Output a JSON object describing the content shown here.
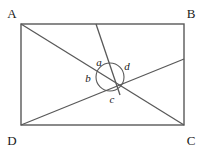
{
  "figure": {
    "stroke_color": "#595959",
    "label_color": "#1a1a1a",
    "background": "#ffffff",
    "vertices": [
      {
        "name": "A",
        "label": "A",
        "x": 21,
        "y": 24,
        "label_x": 12,
        "label_y": 18
      },
      {
        "name": "B",
        "label": "B",
        "x": 184,
        "y": 24,
        "label_x": 188,
        "label_y": 18
      },
      {
        "name": "C",
        "label": "C",
        "x": 184,
        "y": 125,
        "label_x": 188,
        "label_y": 140
      },
      {
        "name": "D",
        "label": "D",
        "x": 21,
        "y": 125,
        "label_x": 12,
        "label_y": 140
      }
    ],
    "intersection": {
      "x": 108,
      "y": 76
    },
    "rectangle": {
      "x": 21,
      "y": 24,
      "width": 163,
      "height": 101
    },
    "segments": [
      {
        "name": "diagonal-a-c",
        "from": "A",
        "to": "C",
        "x1": 21,
        "y1": 24,
        "x2": 184,
        "y2": 125
      },
      {
        "name": "cevian-d-right",
        "from": "D",
        "to": "right-edge",
        "x1": 21,
        "y1": 125,
        "x2": 184,
        "y2": 59
      },
      {
        "name": "cevian-top-down",
        "from": "top-edge",
        "to": "intersection-through",
        "x1": 96,
        "y1": 24,
        "x2": 120,
        "y2": 95
      }
    ],
    "angle_circle": {
      "cx": 110,
      "cy": 77,
      "r": 14
    },
    "angle_labels": [
      {
        "name": "angle-a",
        "label": "a",
        "x": 99,
        "y": 64
      },
      {
        "name": "angle-b",
        "label": "b",
        "x": 88,
        "y": 80
      },
      {
        "name": "angle-c",
        "label": "c",
        "x": 112,
        "y": 101
      },
      {
        "name": "angle-d",
        "label": "d",
        "x": 127,
        "y": 68
      }
    ]
  }
}
